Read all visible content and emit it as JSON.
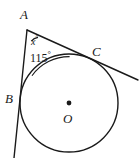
{
  "figure": {
    "type": "geometry-diagram",
    "background_color": "#ffffff",
    "stroke_color": "#1a1a1a",
    "labels": {
      "vertex_a": "A",
      "vertex_b": "B",
      "vertex_c": "C",
      "center_o": "O",
      "angle_x": "x",
      "angle_x_unit": "°",
      "angle_115": "115",
      "angle_115_unit": "°"
    },
    "geometry": {
      "circle": {
        "center_x": 69,
        "center_y": 103,
        "radius": 49
      },
      "center_dot_radius": 2.4,
      "apex": {
        "x": 27,
        "y": 30
      },
      "tangent_point_b": {
        "x": 22.5,
        "y": 92
      },
      "tangent_point_c": {
        "x": 88,
        "y": 58
      },
      "tangent_line_left_end": {
        "x": 14,
        "y": 158
      },
      "tangent_line_right_end": {
        "x": 138,
        "y": 80
      },
      "angle_arc_x": {
        "radius": 11,
        "start_x": 31.2,
        "start_y": 41.2,
        "end_x": 38.0,
        "end_y": 37.4
      },
      "angle_arc_115": {
        "radius": 46,
        "start_x": 32.0,
        "start_y": 75.7,
        "end_x": 69.6,
        "end_y": 56.6
      }
    }
  }
}
